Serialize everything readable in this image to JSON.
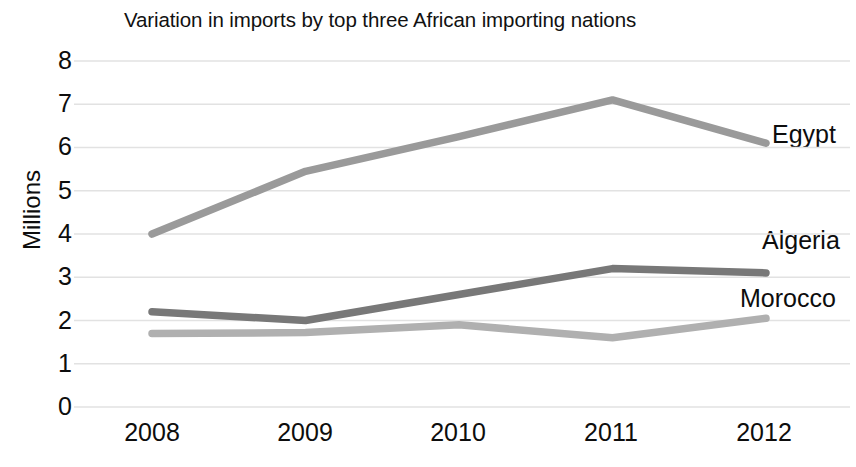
{
  "chart_data": {
    "type": "line",
    "title": "Variation in imports by top three African importing nations",
    "xlabel": "",
    "ylabel": "Millions",
    "categories": [
      "2008",
      "2009",
      "2010",
      "2011",
      "2012"
    ],
    "ylim": [
      0,
      8
    ],
    "yticks": [
      "0",
      "1",
      "2",
      "3",
      "4",
      "5",
      "6",
      "7",
      "8"
    ],
    "grid": "horizontal",
    "legend_position": "right-end-labels",
    "series": [
      {
        "name": "Egypt",
        "values": [
          4.0,
          5.45,
          6.25,
          7.1,
          6.1
        ],
        "color": "#9a9a9a"
      },
      {
        "name": "Algeria",
        "values": [
          2.2,
          2.0,
          2.6,
          3.2,
          3.1
        ],
        "color": "#787878"
      },
      {
        "name": "Morocco",
        "values": [
          1.7,
          1.72,
          1.9,
          1.6,
          2.05
        ],
        "color": "#b0b0b0"
      }
    ]
  },
  "axis": {
    "y_title": "Millions",
    "y_ticks": [
      "8",
      "7",
      "6",
      "5",
      "4",
      "3",
      "2",
      "1",
      "0"
    ],
    "x_ticks": [
      "2008",
      "2009",
      "2010",
      "2011",
      "2012"
    ]
  },
  "labels": {
    "egypt": "Egypt",
    "algeria": "Algeria",
    "morocco": "Morocco"
  }
}
